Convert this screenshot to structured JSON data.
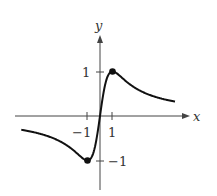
{
  "chart_data": {
    "type": "line",
    "title": "",
    "xlabel": "x",
    "ylabel": "y",
    "function": "y = 2x/(1+x^2)",
    "xlim": [
      -6.8,
      7.2
    ],
    "ylim": [
      -1.7,
      1.8
    ],
    "x_ticks": [
      {
        "value": -1,
        "label": "−1"
      },
      {
        "value": 1,
        "label": "1"
      }
    ],
    "y_ticks": [
      {
        "value": 1,
        "label": "1"
      },
      {
        "value": -1,
        "label": "−1"
      }
    ],
    "series": [
      {
        "name": "curve",
        "x": [
          -6.3,
          -5,
          -4,
          -3,
          -2,
          -1.5,
          -1,
          -0.5,
          0,
          0.5,
          1,
          1.5,
          2,
          3,
          4,
          5,
          6
        ],
        "y": [
          -0.31,
          -0.38,
          -0.47,
          -0.6,
          -0.8,
          -0.92,
          -1,
          -0.8,
          0,
          0.8,
          1,
          0.92,
          0.8,
          0.6,
          0.47,
          0.38,
          0.32
        ]
      }
    ],
    "points": [
      {
        "x": 1,
        "y": 1
      },
      {
        "x": -1,
        "y": -1
      }
    ],
    "grid": false,
    "legend": "none"
  },
  "labels": {
    "x": "x",
    "y": "y",
    "tick_x_neg": "−1",
    "tick_x_pos": "1",
    "tick_y_pos": "1",
    "tick_y_neg": "−1"
  }
}
